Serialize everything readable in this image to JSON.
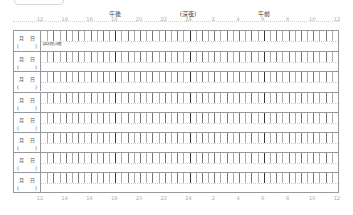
{
  "header": {
    "periods": [
      {
        "label": "午後",
        "x": 115
      },
      {
        "label": "(深夜)",
        "x": 188
      },
      {
        "label": "午前",
        "x": 264
      }
    ]
  },
  "axis": {
    "hours": [
      "12",
      "14",
      "16",
      "18",
      "20",
      "22",
      "24",
      "2",
      "4",
      "6",
      "8",
      "10",
      "12"
    ],
    "major_hours": [
      "18",
      "24",
      "6"
    ]
  },
  "rows": [
    {
      "month": "月",
      "day": "日",
      "open": "(",
      "close": ")",
      "note": "(記入例)入眠"
    },
    {
      "month": "月",
      "day": "日",
      "open": "(",
      "close": ")",
      "note": ""
    },
    {
      "month": "月",
      "day": "日",
      "open": "(",
      "close": ")",
      "note": ""
    },
    {
      "month": "月",
      "day": "日",
      "open": "(",
      "close": ")",
      "note": ""
    },
    {
      "month": "月",
      "day": "日",
      "open": "(",
      "close": ")",
      "note": ""
    },
    {
      "month": "月",
      "day": "日",
      "open": "(",
      "close": ")",
      "note": ""
    },
    {
      "month": "月",
      "day": "日",
      "open": "(",
      "close": ")",
      "note": ""
    },
    {
      "month": "月",
      "day": "日",
      "open": "(",
      "close": ")",
      "note": ""
    }
  ],
  "colors": {
    "grid": "#999999",
    "tick": "#777777",
    "major_tick": "#333333"
  }
}
